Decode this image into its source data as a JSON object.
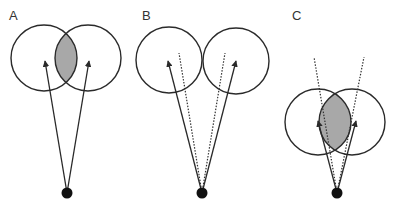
{
  "figure": {
    "width": 396,
    "height": 205,
    "colors": {
      "stroke": "#2a2a2a",
      "overlap_fill": "#a8a8a8",
      "dot": "#111111"
    },
    "panels": [
      {
        "id": "A",
        "label": "A",
        "label_pos": [
          9,
          20
        ],
        "circles": [
          {
            "cx": 44,
            "cy": 58,
            "r": 33
          },
          {
            "cx": 88,
            "cy": 58,
            "r": 33
          }
        ],
        "overlap_shaded": true,
        "origin": [
          67,
          193
        ],
        "arrows": [
          [
            45,
            61
          ],
          [
            89,
            61
          ]
        ],
        "dotted_lines": []
      },
      {
        "id": "B",
        "label": "B",
        "label_pos": [
          142,
          20
        ],
        "circles": [
          {
            "cx": 169,
            "cy": 60,
            "r": 33
          },
          {
            "cx": 236,
            "cy": 61,
            "r": 33
          }
        ],
        "overlap_shaded": false,
        "origin": [
          202,
          193
        ],
        "arrows": [
          [
            168,
            61
          ],
          [
            236,
            61
          ]
        ],
        "dotted_lines": [
          [
            179,
            53
          ],
          [
            225,
            53
          ]
        ]
      },
      {
        "id": "C",
        "label": "C",
        "label_pos": [
          292,
          20
        ],
        "circles": [
          {
            "cx": 318,
            "cy": 122,
            "r": 33
          },
          {
            "cx": 352,
            "cy": 122,
            "r": 33
          }
        ],
        "overlap_shaded": true,
        "origin": [
          337,
          193
        ],
        "arrows": [
          [
            318,
            121
          ],
          [
            356,
            121
          ]
        ],
        "dotted_lines": [
          [
            314,
            57
          ],
          [
            364,
            57
          ]
        ]
      }
    ]
  }
}
